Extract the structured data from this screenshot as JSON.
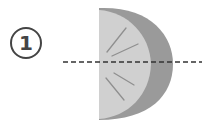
{
  "step": {
    "number": "1"
  },
  "figure": {
    "cut_line": "dashed horizontal line",
    "colors": {
      "rind": "#9a9a9a",
      "flesh": "#cfcfcf",
      "segments": "#8a8a8a",
      "cut_line": "#333333",
      "badge": "#444444"
    }
  }
}
